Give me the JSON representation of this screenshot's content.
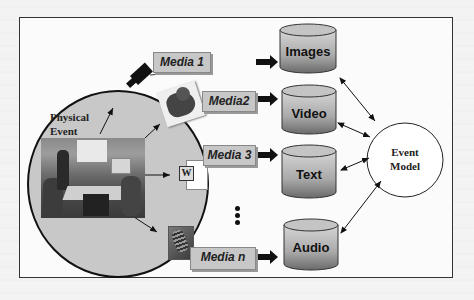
{
  "diagram": {
    "source": {
      "label_line1": "Physical",
      "label_line2": "Event"
    },
    "media": [
      {
        "label": "Media 1",
        "icon": "video-camera-icon"
      },
      {
        "label": "Media2",
        "icon": "robot-photo-icon"
      },
      {
        "label": "Media 3",
        "icon": "word-document-icon"
      },
      {
        "label": "Media n",
        "icon": "microphone-icon"
      }
    ],
    "ellipsis": "...",
    "databases": [
      {
        "label": "Images"
      },
      {
        "label": "Video"
      },
      {
        "label": "Text"
      },
      {
        "label": "Audio"
      }
    ],
    "model": {
      "label_line1": "Event",
      "label_line2": "Model"
    },
    "colors": {
      "frame_border": "#333333",
      "circle_fill": "#c8c8c8",
      "label_fill": "#c7c7c7",
      "db_top": "#cfcfcf",
      "db_bottom": "#6e6e6e"
    }
  }
}
